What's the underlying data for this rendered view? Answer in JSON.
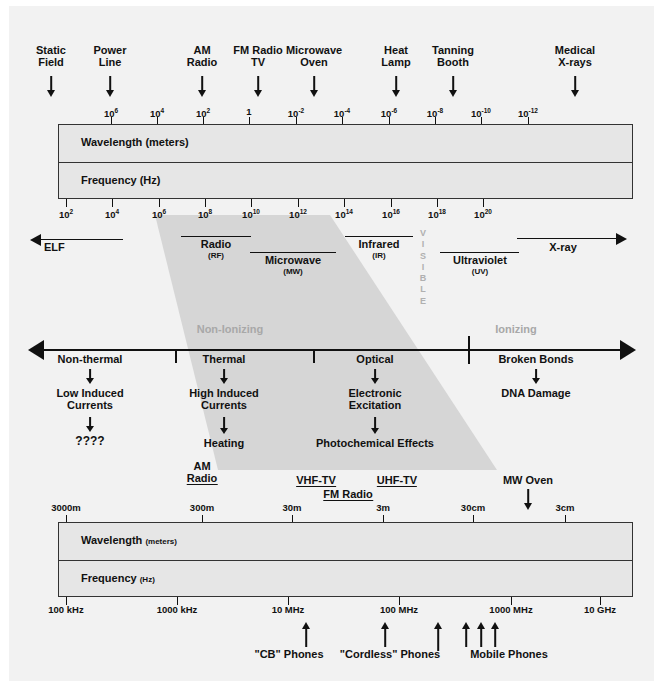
{
  "diagram": {
    "colors": {
      "panel": "#f2f2f2",
      "box_fill": "#e6e6e6",
      "ink": "#111111",
      "wedge": "#d4d4d4",
      "gray_text": "#a8a8a8"
    }
  },
  "top_sources": [
    {
      "label": "Static\nField",
      "x": 51
    },
    {
      "label": "Power\nLine",
      "x": 110
    },
    {
      "label": "AM\nRadio",
      "x": 202
    },
    {
      "label": "FM Radio\nTV",
      "x": 258
    },
    {
      "label": "Microwave\nOven",
      "x": 313
    },
    {
      "label": "Heat\nLamp",
      "x": 396
    },
    {
      "label": "Tanning\nBooth",
      "x": 452
    },
    {
      "label": "Medical\nX-rays",
      "x": 574
    }
  ],
  "top_wavelength_axis": {
    "label": "Wavelength (meters)",
    "ticks": [
      {
        "text": "10",
        "exp": "6",
        "x": 111
      },
      {
        "text": "10",
        "exp": "4",
        "x": 157
      },
      {
        "text": "10",
        "exp": "2",
        "x": 203
      },
      {
        "text": "1",
        "exp": "",
        "x": 249
      },
      {
        "text": "10",
        "exp": "-2",
        "x": 296
      },
      {
        "text": "10",
        "exp": "-4",
        "x": 342
      },
      {
        "text": "10",
        "exp": "-6",
        "x": 389
      },
      {
        "text": "10",
        "exp": "-8",
        "x": 435
      },
      {
        "text": "10",
        "exp": "-10",
        "x": 481
      },
      {
        "text": "10",
        "exp": "-12",
        "x": 528
      }
    ]
  },
  "top_frequency_axis": {
    "label": "Frequency (Hz)",
    "ticks": [
      {
        "text": "10",
        "exp": "2",
        "x": 66
      },
      {
        "text": "10",
        "exp": "4",
        "x": 112
      },
      {
        "text": "10",
        "exp": "6",
        "x": 159
      },
      {
        "text": "10",
        "exp": "8",
        "x": 205
      },
      {
        "text": "10",
        "exp": "10",
        "x": 251
      },
      {
        "text": "10",
        "exp": "12",
        "x": 298
      },
      {
        "text": "10",
        "exp": "14",
        "x": 344
      },
      {
        "text": "10",
        "exp": "16",
        "x": 391
      },
      {
        "text": "10",
        "exp": "18",
        "x": 437
      },
      {
        "text": "10",
        "exp": "20",
        "x": 483
      }
    ]
  },
  "bands": [
    {
      "name": "ELF",
      "abbrev": "",
      "x1": 38,
      "x2": 120,
      "label_x": 58,
      "arrow": "left"
    },
    {
      "name": "Radio",
      "abbrev": "(RF)",
      "x1": 160,
      "x2": 255,
      "label_x": 208,
      "arrow": "none"
    },
    {
      "name": "Microwave",
      "abbrev": "(MW)",
      "x1": 250,
      "x2": 345,
      "label_x": 298,
      "arrow": "none"
    },
    {
      "name": "Infrared",
      "abbrev": "(IR)",
      "x1": 330,
      "x2": 420,
      "label_x": 375,
      "arrow": "none"
    },
    {
      "name": "Ultraviolet",
      "abbrev": "(UV)",
      "x1": 440,
      "x2": 520,
      "label_x": 480,
      "arrow": "none"
    },
    {
      "name": "X-ray",
      "abbrev": "",
      "x1": 500,
      "x2": 620,
      "label_x": 552,
      "arrow": "right"
    }
  ],
  "visible_band": {
    "letters": "V\nI\nS\nI\nB\nL\nE",
    "x": 423
  },
  "ionizing_scale": {
    "non_ionizing_label": "Non-Ionizing",
    "ionizing_label": "Ionizing",
    "non_ionizing_x": 230,
    "ionizing_x": 514,
    "dividers_x": [
      175,
      305,
      442
    ],
    "segments": [
      {
        "name": "Non-thermal",
        "x": 90,
        "effect1": "Low Induced\nCurrents",
        "effect2": "????"
      },
      {
        "name": "Thermal",
        "x": 222,
        "effect1": "High Induced\nCurrents",
        "effect2": "Heating"
      },
      {
        "name": "Optical",
        "x": 373,
        "effect1": "Electronic\nExcitation",
        "effect2": "Photochemical Effects"
      },
      {
        "name": "Broken Bonds",
        "x": 534,
        "effect1": "DNA Damage",
        "effect2": ""
      }
    ]
  },
  "bottom_sources": [
    {
      "label": "AM\nRadio",
      "x": 202,
      "underline": true,
      "arrow": false
    },
    {
      "label": "VHF-TV",
      "x": 314,
      "underline": true,
      "arrow": false
    },
    {
      "label": "UHF-TV",
      "x": 395,
      "underline": true,
      "arrow": false
    },
    {
      "label": "FM Radio",
      "x": 347,
      "underline": true,
      "arrow": false
    },
    {
      "label": "MW Oven",
      "x": 528,
      "underline": false,
      "arrow": true
    }
  ],
  "bottom_wavelength_axis": {
    "label": "Wavelength",
    "unit": "(meters)",
    "ticks": [
      {
        "text": "3000m",
        "x": 66
      },
      {
        "text": "300m",
        "x": 202
      },
      {
        "text": "30m",
        "x": 292
      },
      {
        "text": "3m",
        "x": 383
      },
      {
        "text": "30cm",
        "x": 473
      },
      {
        "text": "3cm",
        "x": 565
      }
    ]
  },
  "bottom_frequency_axis": {
    "label": "Frequency",
    "unit": "(Hz)",
    "ticks": [
      {
        "text": "100 kHz",
        "x": 66
      },
      {
        "text": "1000 kHz",
        "x": 177
      },
      {
        "text": "10 MHz",
        "x": 288
      },
      {
        "text": "100 MHz",
        "x": 399
      },
      {
        "text": "1000 MHz",
        "x": 511
      },
      {
        "text": "10 GHz",
        "x": 600
      }
    ]
  },
  "bottom_annotations": [
    {
      "label": "\"CB\" Phones",
      "text_x": 288,
      "arrows_x": [
        306
      ]
    },
    {
      "label": "\"Cordless\" Phones",
      "text_x": 388,
      "arrows_x": [
        385,
        438
      ]
    },
    {
      "label": "Mobile Phones",
      "text_x": 508,
      "arrows_x": [
        466,
        500,
        512
      ]
    }
  ]
}
